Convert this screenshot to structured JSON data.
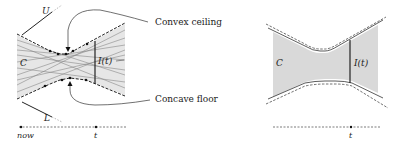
{
  "left_figure": {
    "labels": {
      "upper": "U",
      "lower": "L",
      "region": "C",
      "interval": "I(t)",
      "ceiling": "Convex ceiling",
      "floor": "Concave floor",
      "now": "now",
      "time": "t"
    }
  },
  "right_figure": {
    "labels": {
      "region": "C",
      "interval": "I(t)",
      "time": "t"
    }
  },
  "colors": {
    "fill": "#e6e6e6",
    "ink": "#222222"
  }
}
